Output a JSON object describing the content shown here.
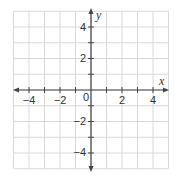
{
  "chart_data": {
    "type": "coordinate-plane",
    "title": "",
    "xlabel": "x",
    "ylabel": "y",
    "xlim": [
      -5,
      5
    ],
    "ylim": [
      -5,
      5
    ],
    "grid": true,
    "grid_step": 1,
    "x_tick_labels": [
      "−4",
      "−2",
      "2",
      "4"
    ],
    "x_tick_values": [
      -4,
      -2,
      2,
      4
    ],
    "y_tick_labels": [
      "4",
      "2",
      "−2",
      "−4"
    ],
    "y_tick_values": [
      4,
      2,
      -2,
      -4
    ],
    "origin_label": "0",
    "series": []
  },
  "colors": {
    "grid": "#d9d9d9",
    "axis": "#444444",
    "text": "#333333",
    "background": "#ffffff"
  },
  "axes": {
    "x_label": "x",
    "y_label": "y",
    "origin": "0",
    "x_ticks": {
      "neg4": "−4",
      "neg2": "−2",
      "pos2": "2",
      "pos4": "4"
    },
    "y_ticks": {
      "pos4": "4",
      "pos2": "2",
      "neg2": "−2",
      "neg4": "−4"
    }
  }
}
